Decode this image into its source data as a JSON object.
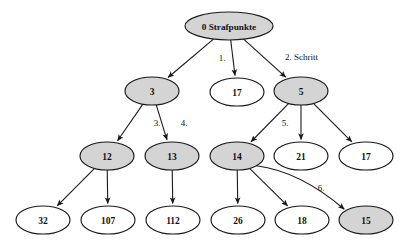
{
  "diagram": {
    "colors": {
      "shaded_fill": "#d4d4d4",
      "plain_fill": "#ffffff",
      "stroke": "#1a1a1a",
      "background": "#ffffff"
    },
    "nodes": [
      {
        "id": "root",
        "label": "0 Strafpunkte",
        "shaded": true,
        "cx": 229,
        "cy": 26,
        "rx": 44,
        "ry": 14
      },
      {
        "id": "n3",
        "label": "3",
        "shaded": true,
        "cx": 152,
        "cy": 91,
        "rx": 27,
        "ry": 14
      },
      {
        "id": "n17a",
        "label": "17",
        "shaded": false,
        "cx": 237,
        "cy": 92,
        "rx": 27,
        "ry": 14
      },
      {
        "id": "n5",
        "label": "5",
        "shaded": true,
        "cx": 301,
        "cy": 91,
        "rx": 27,
        "ry": 14
      },
      {
        "id": "n12",
        "label": "12",
        "shaded": true,
        "cx": 107,
        "cy": 156,
        "rx": 27,
        "ry": 14
      },
      {
        "id": "n13",
        "label": "13",
        "shaded": true,
        "cx": 172,
        "cy": 156,
        "rx": 27,
        "ry": 14
      },
      {
        "id": "n14",
        "label": "14",
        "shaded": true,
        "cx": 237,
        "cy": 156,
        "rx": 27,
        "ry": 14
      },
      {
        "id": "n21",
        "label": "21",
        "shaded": false,
        "cx": 301,
        "cy": 156,
        "rx": 27,
        "ry": 14
      },
      {
        "id": "n17b",
        "label": "17",
        "shaded": false,
        "cx": 366,
        "cy": 156,
        "rx": 27,
        "ry": 14
      },
      {
        "id": "n32",
        "label": "32",
        "shaded": false,
        "cx": 43,
        "cy": 220,
        "rx": 27,
        "ry": 14
      },
      {
        "id": "n107",
        "label": "107",
        "shaded": false,
        "cx": 108,
        "cy": 220,
        "rx": 27,
        "ry": 14
      },
      {
        "id": "n112",
        "label": "112",
        "shaded": false,
        "cx": 173,
        "cy": 220,
        "rx": 27,
        "ry": 14
      },
      {
        "id": "n26",
        "label": "26",
        "shaded": false,
        "cx": 238,
        "cy": 220,
        "rx": 27,
        "ry": 14
      },
      {
        "id": "n18",
        "label": "18",
        "shaded": false,
        "cx": 302,
        "cy": 220,
        "rx": 27,
        "ry": 14
      },
      {
        "id": "n15",
        "label": "15",
        "shaded": true,
        "cx": 366,
        "cy": 220,
        "rx": 27,
        "ry": 14
      }
    ],
    "edges": [
      {
        "id": "e-root-3",
        "from": "root",
        "to": "n3"
      },
      {
        "id": "e-root-17a",
        "from": "root",
        "to": "n17a"
      },
      {
        "id": "e-root-5",
        "from": "root",
        "to": "n5"
      },
      {
        "id": "e-3-12",
        "from": "n3",
        "to": "n12"
      },
      {
        "id": "e-3-13",
        "from": "n3",
        "to": "n13"
      },
      {
        "id": "e-5-14",
        "from": "n5",
        "to": "n14"
      },
      {
        "id": "e-5-21",
        "from": "n5",
        "to": "n21"
      },
      {
        "id": "e-5-17b",
        "from": "n5",
        "to": "n17b"
      },
      {
        "id": "e-12-32",
        "from": "n12",
        "to": "n32"
      },
      {
        "id": "e-12-107",
        "from": "n12",
        "to": "n107"
      },
      {
        "id": "e-13-112",
        "from": "n13",
        "to": "n112"
      },
      {
        "id": "e-14-26",
        "from": "n14",
        "to": "n26"
      },
      {
        "id": "e-14-18",
        "from": "n14",
        "to": "n18"
      },
      {
        "id": "e-14-15",
        "from": "n14",
        "to": "n15"
      }
    ],
    "edge_labels": [
      {
        "id": "lbl-1",
        "text": "1.",
        "x": 222,
        "y": 58
      },
      {
        "id": "lbl-2",
        "text": "2. Schritt",
        "x": 285,
        "y": 57
      },
      {
        "id": "lbl-3",
        "text": "3.",
        "x": 157,
        "y": 123
      },
      {
        "id": "lbl-4",
        "text": "4.",
        "x": 184,
        "y": 123
      },
      {
        "id": "lbl-5",
        "text": "5.",
        "x": 285,
        "y": 123
      },
      {
        "id": "lbl-6",
        "text": "6.",
        "x": 321,
        "y": 188
      }
    ]
  }
}
